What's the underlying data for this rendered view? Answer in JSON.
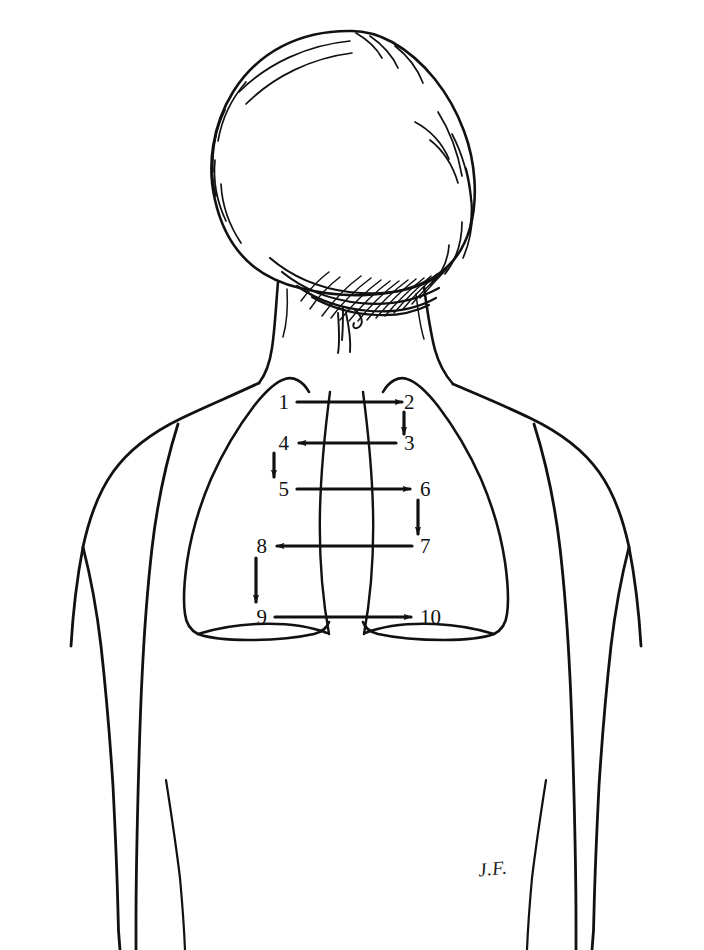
{
  "figure": {
    "background_color": "#ffffff",
    "ink_color": "#111111",
    "signature": "J.F."
  },
  "sequence": {
    "description": "Numbered stethoscope placement points on the posterior chest, alternating side to side down the back",
    "labels": [
      {
        "n": "1",
        "x": 289,
        "y": 402,
        "align": "right"
      },
      {
        "n": "2",
        "x": 404,
        "y": 402,
        "align": "left"
      },
      {
        "n": "3",
        "x": 404,
        "y": 443,
        "align": "left"
      },
      {
        "n": "4",
        "x": 289,
        "y": 443,
        "align": "right"
      },
      {
        "n": "5",
        "x": 289,
        "y": 489,
        "align": "right"
      },
      {
        "n": "6",
        "x": 420,
        "y": 489,
        "align": "left"
      },
      {
        "n": "7",
        "x": 420,
        "y": 546,
        "align": "left"
      },
      {
        "n": "8",
        "x": 267,
        "y": 546,
        "align": "right"
      },
      {
        "n": "9",
        "x": 267,
        "y": 617,
        "align": "right"
      },
      {
        "n": "10",
        "x": 420,
        "y": 617,
        "align": "left"
      }
    ],
    "steps": [
      {
        "from": "1",
        "to": "2",
        "direction": "right"
      },
      {
        "from": "2",
        "to": "3",
        "direction": "down"
      },
      {
        "from": "3",
        "to": "4",
        "direction": "left"
      },
      {
        "from": "4",
        "to": "5",
        "direction": "down"
      },
      {
        "from": "5",
        "to": "6",
        "direction": "right"
      },
      {
        "from": "6",
        "to": "7",
        "direction": "down"
      },
      {
        "from": "7",
        "to": "8",
        "direction": "left"
      },
      {
        "from": "8",
        "to": "9",
        "direction": "down"
      },
      {
        "from": "9",
        "to": "10",
        "direction": "right"
      }
    ]
  }
}
